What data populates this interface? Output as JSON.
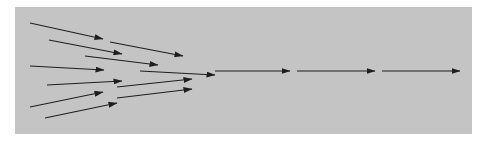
{
  "diagram": {
    "panel": {
      "x": 15,
      "y": 7,
      "width": 457,
      "height": 127,
      "color": "#c4c4c4"
    },
    "arrow_color": "#1e1e1e",
    "converging_arrows": [
      {
        "x1": 30,
        "y1": 23,
        "x2": 103,
        "y2": 39
      },
      {
        "x1": 49,
        "y1": 40,
        "x2": 122,
        "y2": 54
      },
      {
        "x1": 110,
        "y1": 42,
        "x2": 183,
        "y2": 56
      },
      {
        "x1": 85,
        "y1": 56,
        "x2": 158,
        "y2": 65
      },
      {
        "x1": 30,
        "y1": 66,
        "x2": 104,
        "y2": 70
      },
      {
        "x1": 140,
        "y1": 71,
        "x2": 215,
        "y2": 75
      },
      {
        "x1": 47,
        "y1": 85,
        "x2": 122,
        "y2": 81
      },
      {
        "x1": 117,
        "y1": 87,
        "x2": 192,
        "y2": 79
      },
      {
        "x1": 30,
        "y1": 107,
        "x2": 103,
        "y2": 92
      },
      {
        "x1": 117,
        "y1": 98,
        "x2": 192,
        "y2": 89
      },
      {
        "x1": 45,
        "y1": 118,
        "x2": 117,
        "y2": 103
      }
    ],
    "chain_arrows": [
      {
        "x1": 215,
        "y1": 71,
        "x2": 290,
        "y2": 71
      },
      {
        "x1": 297,
        "y1": 71,
        "x2": 375,
        "y2": 71
      },
      {
        "x1": 382,
        "y1": 71,
        "x2": 460,
        "y2": 71
      }
    ]
  }
}
